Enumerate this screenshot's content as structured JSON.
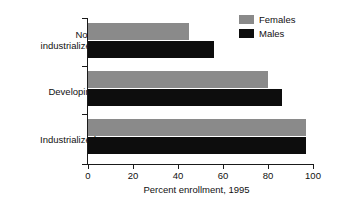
{
  "chart_data": {
    "type": "bar",
    "orientation": "horizontal",
    "title": "",
    "xlabel": "Percent enrollment, 1995",
    "ylabel": "",
    "xlim": [
      0,
      100
    ],
    "xticks": [
      0,
      20,
      40,
      60,
      80,
      100
    ],
    "xtick_labels": [
      "0",
      "20",
      "40",
      "60",
      "80",
      "100"
    ],
    "grid": false,
    "legend_position": "top-right",
    "categories": [
      "Non-\nindustrialized",
      "Developing",
      "Industrialized"
    ],
    "category_labels_flat": [
      "Non-industrialized",
      "Developing",
      "Industrialized"
    ],
    "series": [
      {
        "name": "Females",
        "color": "#8a8a8a",
        "values": [
          45,
          80,
          97
        ]
      },
      {
        "name": "Males",
        "color": "#0d0d0d",
        "values": [
          56,
          86,
          97
        ]
      }
    ]
  },
  "legend": {
    "items": [
      {
        "label": "Females",
        "swatch": "females-swatch"
      },
      {
        "label": "Males",
        "swatch": "males-swatch"
      }
    ]
  },
  "axis": {
    "x_title": "Percent enrollment, 1995",
    "tick_labels": [
      "0",
      "20",
      "40",
      "60",
      "80",
      "100"
    ]
  },
  "colors": {
    "females": "#8a8a8a",
    "males": "#0d0d0d",
    "axis": "#1a1a1a",
    "text": "#111111",
    "background": "#ffffff"
  }
}
